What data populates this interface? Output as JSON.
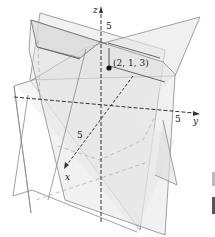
{
  "figure": {
    "axes": {
      "x": {
        "label": "x",
        "tick_label": "5"
      },
      "y": {
        "label": "y",
        "tick_label": "5"
      },
      "z": {
        "label": "z",
        "tick_label": "5"
      }
    },
    "intersection_point": {
      "label": "(2, 1, 3)",
      "coords": [
        2,
        1,
        3
      ]
    },
    "colors": {
      "plane_fill": "#e9e9e9",
      "plane_fill_dark": "#dcdcdc",
      "plane_edge": "#8a8a8a",
      "axis": "#333333",
      "hidden_line": "#b0b0b0",
      "point": "#111111"
    }
  }
}
